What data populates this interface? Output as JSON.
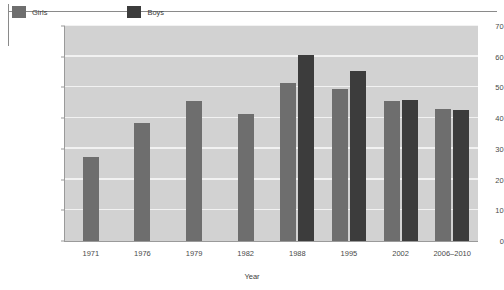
{
  "chart_data": {
    "type": "bar",
    "title": "",
    "xlabel": "Year",
    "ylabel": "Percentage",
    "categories": [
      "1971",
      "1976",
      "1979",
      "1982",
      "1988",
      "1995",
      "2002",
      "2006–2010"
    ],
    "ylim": [
      0,
      70
    ],
    "yticks": [
      0,
      10,
      20,
      30,
      40,
      50,
      60,
      70
    ],
    "grid": true,
    "legend_position": "inside-top-left",
    "series": [
      {
        "name": "Girls",
        "color": "#6e6e6e",
        "values": [
          27.5,
          38.5,
          45.5,
          41.5,
          51.5,
          49.5,
          45.5,
          43.0
        ]
      },
      {
        "name": "Boys",
        "color": "#3c3c3c",
        "values": [
          null,
          null,
          null,
          null,
          60.5,
          55.5,
          46.0,
          42.5
        ]
      }
    ]
  },
  "legend": {
    "items": [
      {
        "label": "Girls",
        "swatch": "girls-legend-swatch"
      },
      {
        "label": "Boys",
        "swatch": "boys-legend-swatch"
      }
    ]
  },
  "axes": {
    "y_title": "Percentage",
    "x_title": "Year",
    "y_ticks": [
      "70",
      "60",
      "50",
      "40",
      "30",
      "20",
      "10",
      "0"
    ],
    "x_ticks": [
      "1971",
      "1976",
      "1979",
      "1982",
      "1988",
      "1995",
      "2002",
      "2006–2010"
    ]
  },
  "colors": {
    "girls": "#6e6e6e",
    "boys": "#3c3c3c",
    "plot_background": "#d2d2d2",
    "gridline": "#f2f2f2",
    "axis": "#9a9a9a"
  }
}
